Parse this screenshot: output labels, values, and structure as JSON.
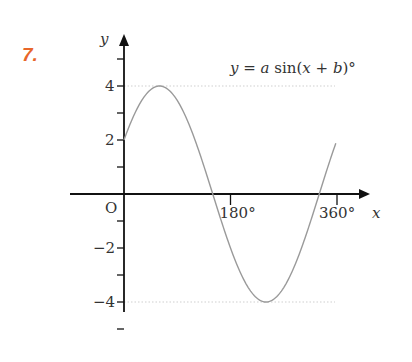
{
  "question_number": "7.",
  "equation": {
    "y": "y",
    "eq": " = ",
    "a": "a",
    "sin": " sin(",
    "x": "x",
    "plus": " + ",
    "b": "b",
    "close": ")°"
  },
  "chart_data": {
    "type": "line",
    "title": "y = a sin(x + b)°",
    "xlabel": "x",
    "ylabel": "y",
    "x_tick_labels": [
      "O",
      "180°",
      "360°"
    ],
    "y_tick_labels": [
      "4",
      "2",
      "−2",
      "−4"
    ],
    "xlim": [
      0,
      400
    ],
    "ylim": [
      -5,
      5.5
    ],
    "grid": false,
    "reference_lines": [
      {
        "y": 4,
        "style": "dotted"
      },
      {
        "y": -4,
        "style": "dotted"
      }
    ],
    "series": [
      {
        "name": "y = 4 sin(x + 30)°",
        "x": [
          0,
          30,
          60,
          90,
          120,
          150,
          180,
          210,
          240,
          270,
          300,
          330,
          360
        ],
        "values": [
          2,
          3.46,
          4,
          3.46,
          2,
          0,
          -2,
          -3.46,
          -4,
          -3.46,
          -2,
          0,
          2
        ]
      }
    ],
    "key_points": {
      "max": [
        60,
        4
      ],
      "min": [
        240,
        -4
      ],
      "y_intercept": 2,
      "x_intercepts": [
        150,
        330
      ]
    },
    "colors": {
      "curve": "#9a9a9a",
      "axes": "#111111",
      "question_number": "#e8662a"
    }
  }
}
